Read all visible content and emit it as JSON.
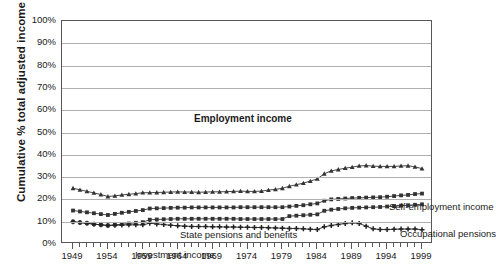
{
  "chart_data": {
    "type": "line",
    "title": "",
    "xlabel": "",
    "ylabel": "Cumulative % total adjusted income",
    "ylim": [
      0,
      100
    ],
    "xlim": [
      1949,
      1999
    ],
    "grid": true,
    "legend": "inline-annotations",
    "y_ticklabels": [
      "100%",
      "90%",
      "80%",
      "70%",
      "60%",
      "50%",
      "40%",
      "30%",
      "20%",
      "10%",
      "0%"
    ],
    "y_tickvalues": [
      100,
      90,
      80,
      70,
      60,
      50,
      40,
      30,
      20,
      10,
      0
    ],
    "x_ticklabels": [
      "1949",
      "1954",
      "1959",
      "1964",
      "1969",
      "1974",
      "1979",
      "1984",
      "1989",
      "1994",
      "1999"
    ],
    "x_tickvalues": [
      1949,
      1954,
      1959,
      1964,
      1969,
      1974,
      1979,
      1984,
      1989,
      1994,
      1999
    ],
    "x": [
      1949,
      1950,
      1951,
      1952,
      1953,
      1954,
      1955,
      1956,
      1957,
      1958,
      1959,
      1960,
      1961,
      1962,
      1963,
      1964,
      1965,
      1966,
      1967,
      1968,
      1969,
      1970,
      1971,
      1972,
      1973,
      1974,
      1975,
      1976,
      1977,
      1978,
      1979,
      1980,
      1981,
      1982,
      1983,
      1984,
      1985,
      1986,
      1987,
      1988,
      1989,
      1990,
      1991,
      1992,
      1993,
      1994,
      1995,
      1996,
      1997,
      1998,
      1999
    ],
    "annotations": [
      {
        "text": "Employment income",
        "series": "employment-income"
      },
      {
        "text": "Self-employment income",
        "series": "self-employment-income"
      },
      {
        "text": "State pensions and benefits",
        "series": "state-pensions-and-benefits"
      },
      {
        "text": "Occupational pensions",
        "series": "occupational-pensions"
      },
      {
        "text": "Investment income",
        "series": "investment-income"
      }
    ],
    "series": [
      {
        "name": "Self-employment income",
        "marker": "triangle",
        "color": "#333333",
        "values": [
          25.0,
          24.3,
          23.6,
          22.9,
          22.2,
          21.3,
          21.6,
          22.0,
          22.3,
          22.6,
          23.0,
          23.0,
          23.1,
          23.2,
          23.3,
          23.4,
          23.3,
          23.3,
          23.2,
          23.3,
          23.4,
          23.4,
          23.5,
          23.6,
          23.7,
          23.6,
          23.6,
          23.7,
          24.2,
          24.5,
          25.0,
          25.9,
          26.6,
          27.3,
          28.2,
          29.2,
          31.5,
          32.8,
          33.4,
          34.0,
          34.5,
          35.0,
          35.2,
          34.9,
          34.8,
          34.8,
          34.8,
          35.0,
          35.1,
          34.6,
          33.8
        ]
      },
      {
        "name": "State pensions and benefits",
        "marker": "square",
        "color": "#333333",
        "values": [
          15.0,
          14.6,
          14.2,
          13.8,
          13.4,
          13.0,
          13.5,
          14.0,
          14.4,
          14.8,
          15.2,
          15.9,
          16.0,
          16.1,
          16.2,
          16.3,
          16.3,
          16.4,
          16.4,
          16.4,
          16.4,
          16.4,
          16.4,
          16.4,
          16.5,
          16.5,
          16.5,
          16.5,
          16.5,
          16.5,
          16.5,
          16.8,
          17.1,
          17.4,
          17.8,
          18.2,
          19.4,
          20.0,
          20.2,
          20.4,
          20.6,
          20.7,
          20.8,
          20.9,
          21.0,
          21.2,
          21.5,
          21.8,
          22.0,
          22.4,
          22.6
        ]
      },
      {
        "name": "Occupational pensions",
        "marker": "square",
        "color": "#333333",
        "values": [
          10.0,
          9.6,
          9.3,
          8.9,
          8.6,
          8.3,
          8.6,
          8.9,
          9.2,
          9.5,
          9.8,
          10.9,
          11.0,
          11.1,
          11.2,
          11.3,
          11.3,
          11.3,
          11.3,
          11.3,
          11.3,
          11.3,
          11.3,
          11.3,
          11.2,
          11.2,
          11.2,
          11.2,
          11.2,
          11.2,
          11.2,
          12.5,
          12.7,
          12.9,
          13.1,
          13.3,
          14.9,
          15.4,
          15.7,
          16.0,
          16.2,
          16.3,
          16.4,
          16.5,
          16.6,
          16.8,
          17.0,
          17.2,
          17.4,
          17.6,
          17.8
        ]
      },
      {
        "name": "Investment income",
        "marker": "plus",
        "color": "#222222",
        "values": [
          10.0,
          9.6,
          9.3,
          8.9,
          8.6,
          8.3,
          8.4,
          8.5,
          8.6,
          8.6,
          8.6,
          9.3,
          9.0,
          8.7,
          8.4,
          8.2,
          8.0,
          7.9,
          7.8,
          7.8,
          7.7,
          7.7,
          7.6,
          7.6,
          7.5,
          7.5,
          7.4,
          7.4,
          7.3,
          7.2,
          7.1,
          7.0,
          6.9,
          6.8,
          6.6,
          6.5,
          7.7,
          8.3,
          8.8,
          9.2,
          9.5,
          9.2,
          8.0,
          6.8,
          6.5,
          6.5,
          6.6,
          6.7,
          6.7,
          6.7,
          6.4
        ]
      }
    ]
  }
}
